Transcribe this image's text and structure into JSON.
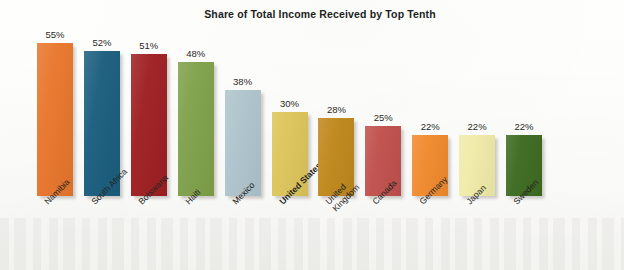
{
  "chart_data": {
    "type": "bar",
    "title": "Share of Total Income Received by Top Tenth",
    "xlabel": "",
    "ylabel": "",
    "ylim": [
      0,
      60
    ],
    "grid": false,
    "legend": "none",
    "value_suffix": "%",
    "highlight_category": "United States",
    "categories": [
      "Namibia",
      "South Africa",
      "Botswana",
      "Haiti",
      "Mexico",
      "United States",
      "United\nKingdom",
      "Canada",
      "Germany",
      "Japan",
      "Sweden"
    ],
    "values": [
      55,
      52,
      51,
      48,
      38,
      30,
      28,
      25,
      22,
      22,
      22
    ],
    "value_labels": [
      "55%",
      "52%",
      "51%",
      "48%",
      "38%",
      "30%",
      "28%",
      "25%",
      "22%",
      "22%",
      "22%"
    ],
    "colors": [
      "#E8762C",
      "#1B5E7E",
      "#9E1F22",
      "#7FA14A",
      "#AEC4CC",
      "#DDC55A",
      "#C0881D",
      "#C0504D",
      "#F08A2E",
      "#F0EBA8",
      "#3D6B21"
    ]
  }
}
